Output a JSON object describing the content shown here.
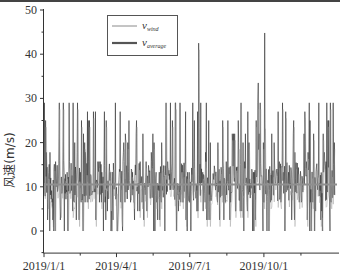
{
  "chart_data": {
    "type": "line",
    "title": "",
    "xlabel": "",
    "ylabel": "风速(m/s)",
    "ylim": [
      -5,
      50
    ],
    "yticks": [
      0,
      10,
      20,
      30,
      40,
      50
    ],
    "xlim_days": [
      0,
      365
    ],
    "xticks": [
      {
        "label": "2019/1/1",
        "day": 0
      },
      {
        "label": "2019/4/1",
        "day": 90
      },
      {
        "label": "2019/7/1",
        "day": 181
      },
      {
        "label": "2019/10/1",
        "day": 273
      }
    ],
    "grid": false,
    "legend": {
      "position": "upper-left-center",
      "entries": [
        {
          "name": "v",
          "sub": "wind",
          "style": "thin",
          "color": "#8a8a8a"
        },
        {
          "name": "v",
          "sub": "average",
          "style": "thick",
          "color": "#555555"
        }
      ]
    },
    "series": [
      {
        "name": "v_wind",
        "description": "Daily-varying wind speed samples, mostly within 0–29 m/s with a dense band around 7–15 m/s",
        "color": "#3a3a3a",
        "range": [
          0,
          45
        ],
        "peaks": [
          {
            "date": "2019/7/12",
            "day": 192,
            "value": 42.5
          },
          {
            "date": "2019/9/24",
            "day": 266,
            "value": 33.5
          },
          {
            "date": "2019/10/2",
            "day": 274,
            "value": 44.8
          },
          {
            "date": "2019/1/20",
            "day": 19,
            "value": 29
          },
          {
            "date": "2019/1/25",
            "day": 24,
            "value": 29
          },
          {
            "date": "2019/3/17",
            "day": 75,
            "value": 27
          }
        ],
        "seed": 20190101,
        "count": 730
      },
      {
        "name": "v_average",
        "description": "Constant mean wind speed",
        "color": "#8f8f8f",
        "value": 10.5
      }
    ]
  }
}
